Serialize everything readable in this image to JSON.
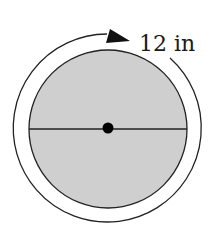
{
  "diagram": {
    "type": "circle-circumference",
    "label": "12 in",
    "colors": {
      "fill": "#cfcfcf",
      "stroke": "#222222",
      "background": "#ffffff"
    },
    "elements": {
      "circle": "shaded disc",
      "diameter_line": "horizontal diameter through center",
      "center_point": "filled dot at center",
      "circumference_arrow": "outer arc with arrowhead indicating circumference"
    }
  }
}
